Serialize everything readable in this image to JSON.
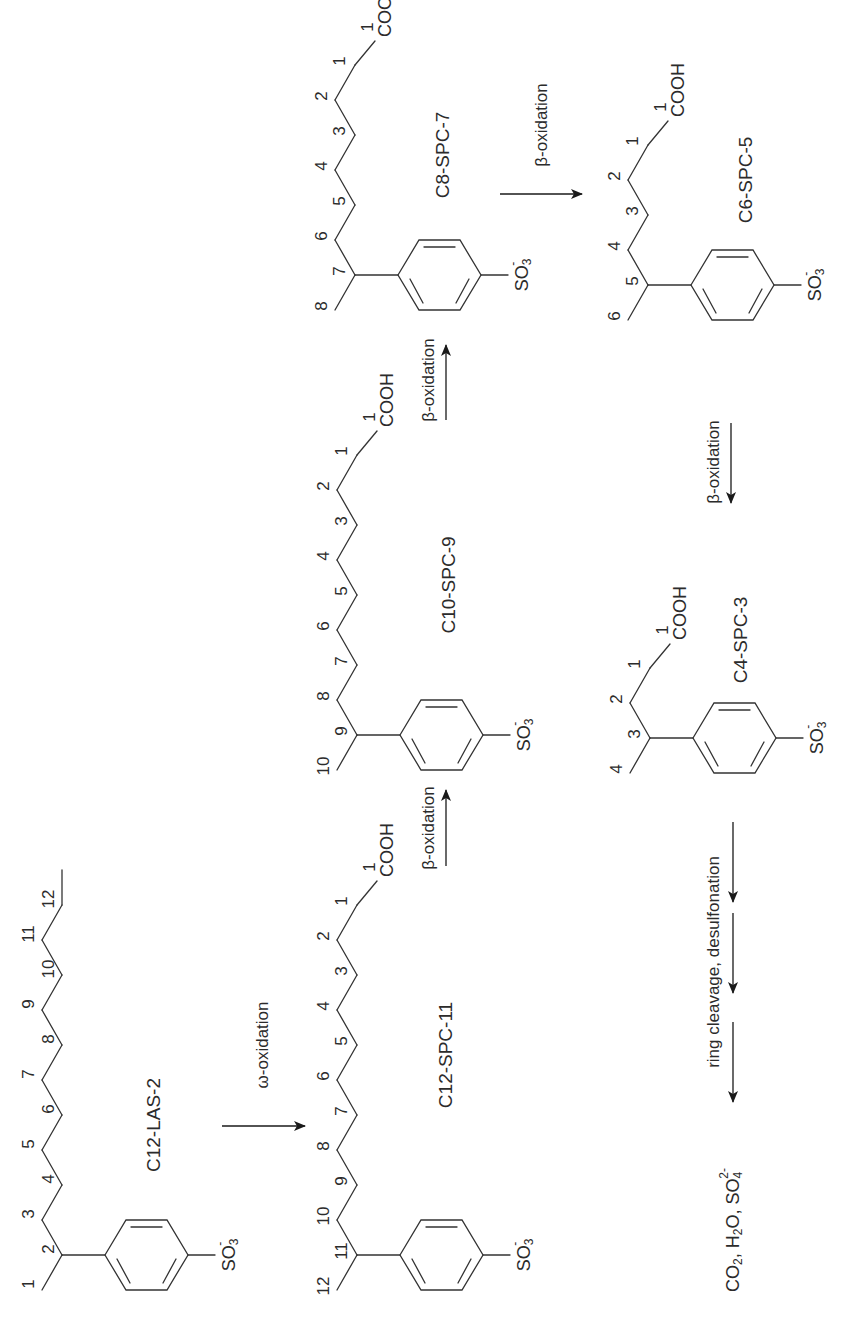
{
  "diagram": {
    "title": "",
    "orientation": "rotated-90-ccw",
    "colors": {
      "ink": "#333333",
      "background": "#ffffff"
    },
    "compounds": [
      {
        "id": "c12-las-2",
        "name": "C12-LAS-2",
        "chain_numbers": [
          "1",
          "2",
          "3",
          "4",
          "5",
          "6",
          "7",
          "8",
          "9",
          "10",
          "11",
          "12"
        ],
        "terminal_group": "",
        "ring_substituent": "SO3-"
      },
      {
        "id": "c12-spc-11",
        "name": "C12-SPC-11",
        "chain_numbers": [
          "12",
          "11",
          "10",
          "9",
          "8",
          "7",
          "6",
          "5",
          "4",
          "3",
          "2",
          "1"
        ],
        "terminal_group": "COOH",
        "ring_substituent": "SO3-"
      },
      {
        "id": "c10-spc-9",
        "name": "C10-SPC-9",
        "chain_numbers": [
          "10",
          "9",
          "8",
          "7",
          "6",
          "5",
          "4",
          "3",
          "2",
          "1"
        ],
        "terminal_group": "COOH",
        "ring_substituent": "SO3-"
      },
      {
        "id": "c8-spc-7",
        "name": "C8-SPC-7",
        "chain_numbers": [
          "8",
          "7",
          "6",
          "5",
          "4",
          "3",
          "2",
          "1"
        ],
        "terminal_group": "COOH",
        "ring_substituent": "SO3-"
      },
      {
        "id": "c6-spc-5",
        "name": "C6-SPC-5",
        "chain_numbers": [
          "6",
          "5",
          "4",
          "3",
          "2",
          "1"
        ],
        "terminal_group": "COOH",
        "ring_substituent": "SO3-"
      },
      {
        "id": "c4-spc-3",
        "name": "C4-SPC-3",
        "chain_numbers": [
          "4",
          "3",
          "2",
          "1"
        ],
        "terminal_group": "COOH",
        "ring_substituent": "SO3-"
      }
    ],
    "so3": {
      "main": "SO",
      "sub": "3",
      "sup": "-"
    },
    "cooh": "COOH",
    "arrows": [
      {
        "id": "omega",
        "label": "ω-oxidation",
        "from": "C12-LAS-2",
        "to": "C12-SPC-11"
      },
      {
        "id": "beta1",
        "label": "β-oxidation",
        "from": "C12-SPC-11",
        "to": "C10-SPC-9"
      },
      {
        "id": "beta2",
        "label": "β-oxidation",
        "from": "C10-SPC-9",
        "to": "C8-SPC-7"
      },
      {
        "id": "beta3",
        "label": "β-oxidation",
        "from": "C8-SPC-7",
        "to": "C6-SPC-5"
      },
      {
        "id": "beta4",
        "label": "β-oxidation",
        "from": "C6-SPC-5",
        "to": "C4-SPC-3"
      },
      {
        "id": "ring",
        "label": "ring cleavage, desulfonation",
        "from": "C4-SPC-3",
        "to": "products"
      }
    ],
    "products": {
      "co2": {
        "main": "CO",
        "sub": "2"
      },
      "h2o": {
        "main": "H",
        "sub": "2",
        "tail": "O"
      },
      "so4": {
        "main": "SO",
        "sub": "4",
        "sup": "2-"
      },
      "sep": ", "
    }
  }
}
